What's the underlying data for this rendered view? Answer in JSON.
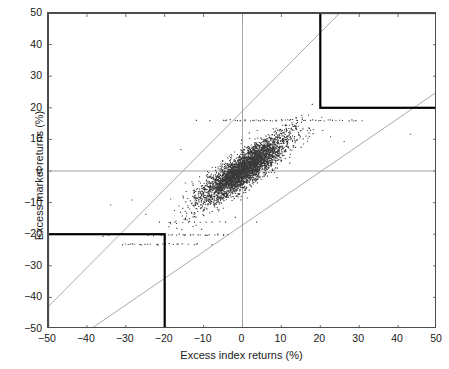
{
  "chart_data": {
    "type": "scatter",
    "title": "",
    "xlabel": "Excess index returns (%)",
    "ylabel": "Excess market returns (%)",
    "xlim": [
      -50,
      50
    ],
    "ylim": [
      -50,
      50
    ],
    "xticks": [
      -50,
      -40,
      -30,
      -20,
      -10,
      0,
      10,
      20,
      30,
      40,
      50
    ],
    "yticks": [
      -50,
      -40,
      -30,
      -20,
      -10,
      0,
      10,
      20,
      30,
      40,
      50
    ],
    "xtick_labels": [
      "-50",
      "-40",
      "-30",
      "-20",
      "-10",
      "0",
      "10",
      "20",
      "30",
      "40",
      "50"
    ],
    "ytick_labels": [
      "-50",
      "-40",
      "-30",
      "-20",
      "-10",
      "0",
      "10",
      "20",
      "30",
      "40",
      "50"
    ],
    "grid": false,
    "legend": null,
    "marker": {
      "shape": "dot",
      "size_px": 1.1,
      "color": "#3a3a3a"
    },
    "zero_lines": {
      "x": 0,
      "y": 0,
      "color": "#9a9a9a"
    },
    "reference_lines": [
      {
        "name": "upper-envelope-line",
        "slope": 1.24,
        "intercept": 19.0,
        "color": "#a0a0a0",
        "p1": [
          -50,
          -43
        ],
        "p2": [
          25,
          50
        ]
      },
      {
        "name": "lower-envelope-line",
        "slope": 0.843,
        "intercept": -17.1,
        "color": "#a0a0a0",
        "p1": [
          -39,
          -50
        ],
        "p2": [
          50,
          25
        ]
      }
    ],
    "highlight_boxes": [
      {
        "name": "upper-right-highlight-box",
        "x0": 20,
        "y0": 20,
        "x1": 50,
        "y1": 50,
        "color": "#000000",
        "line_width": 2.2,
        "fill": "none"
      },
      {
        "name": "lower-left-highlight-box",
        "x0": -50,
        "y0": -50,
        "x1": -20,
        "y1": -20,
        "color": "#000000",
        "line_width": 2.2,
        "fill": "none"
      }
    ],
    "cloud": {
      "description": "Dense positively-correlated cloud of daily excess return pairs centred on the origin",
      "n_points": 4200,
      "center": [
        0.2,
        0.6
      ],
      "correlation": 0.86,
      "sd_x": 4.6,
      "sd_y": 4.4,
      "seed": 20240517
    },
    "banded_rows": [
      {
        "y": 16.2,
        "x_from": -5,
        "x_to": 30,
        "n": 34
      },
      {
        "y": -20.0,
        "x_from": -26,
        "x_to": -4,
        "n": 22
      },
      {
        "y": -23.0,
        "x_from": -30,
        "x_to": -12,
        "n": 18
      }
    ],
    "outliers": [
      [
        -36.0,
        -20.5
      ],
      [
        -34.5,
        -20.2
      ],
      [
        -31.0,
        -23.2
      ],
      [
        -29.5,
        -23.1
      ],
      [
        -28.0,
        -23.0
      ],
      [
        -26.5,
        -23.1
      ],
      [
        -24.5,
        -23.0
      ],
      [
        -23.0,
        -20.3
      ],
      [
        -22.0,
        -23.0
      ],
      [
        -21.0,
        -20.2
      ],
      [
        -20.0,
        -23.1
      ],
      [
        -18.5,
        -20.1
      ],
      [
        -17.0,
        -23.0
      ],
      [
        -15.0,
        -20.2
      ],
      [
        -13.5,
        -20.1
      ],
      [
        -12.0,
        -23.0
      ],
      [
        -11.0,
        -20.1
      ],
      [
        -9.5,
        -20.2
      ],
      [
        -8.0,
        -23.1
      ],
      [
        -6.5,
        -20.1
      ],
      [
        -5.0,
        -20.2
      ],
      [
        -34.0,
        -10.6
      ],
      [
        -28.5,
        -9.0
      ],
      [
        -25.0,
        -13.5
      ],
      [
        -21.5,
        -16.0
      ],
      [
        -19.0,
        -16.1
      ],
      [
        -17.5,
        -16.0
      ],
      [
        -15.5,
        -16.1
      ],
      [
        -14.0,
        -16.0
      ],
      [
        -12.5,
        -16.0
      ],
      [
        -11.0,
        -16.1
      ],
      [
        -9.5,
        -16.0
      ],
      [
        -8.0,
        -16.0
      ],
      [
        -6.0,
        -15.9
      ],
      [
        -4.5,
        -16.0
      ],
      [
        -2.0,
        -14.5
      ],
      [
        3.5,
        -16.0
      ],
      [
        -12.0,
        16.2
      ],
      [
        -8.5,
        16.1
      ],
      [
        -5.0,
        16.2
      ],
      [
        -2.0,
        16.2
      ],
      [
        0.5,
        16.1
      ],
      [
        2.5,
        16.2
      ],
      [
        4.0,
        16.1
      ],
      [
        5.5,
        16.2
      ],
      [
        7.0,
        16.1
      ],
      [
        8.5,
        16.2
      ],
      [
        10.0,
        16.1
      ],
      [
        12.0,
        16.2
      ],
      [
        14.0,
        16.1
      ],
      [
        16.0,
        16.2
      ],
      [
        19.5,
        16.1
      ],
      [
        23.0,
        16.2
      ],
      [
        29.0,
        16.1
      ],
      [
        43.0,
        11.8
      ],
      [
        26.0,
        9.5
      ],
      [
        22.5,
        11.0
      ],
      [
        20.5,
        13.0
      ],
      [
        18.0,
        12.0
      ],
      [
        -16.0,
        7.0
      ]
    ]
  }
}
